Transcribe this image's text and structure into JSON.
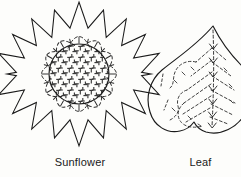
{
  "figure": {
    "type": "line-art-pattern-plate",
    "background_color": "#fdfdfb",
    "ink_color": "#1a1a1a",
    "width": 241,
    "height": 177
  },
  "motifs": [
    {
      "id": "sunflower",
      "name": "sunflower-motif",
      "caption": "Sunflower",
      "center": {
        "x": 79,
        "y": 74
      },
      "outline": {
        "shape": "star",
        "points": 16,
        "outer_radius": 72,
        "inner_radius": 47,
        "stroke": "solid"
      },
      "petal_ring": {
        "shape": "dashed-petal-arcs",
        "count": 12,
        "stroke": "dashed"
      },
      "disc": {
        "shape": "circle",
        "radius": 30,
        "stroke": "solid",
        "fill_texture": "cross-stitch-grid"
      },
      "radial_ticks": {
        "count": 24,
        "stroke": "dashed"
      }
    },
    {
      "id": "leaf",
      "name": "leaf-motif",
      "caption": "Leaf",
      "center": {
        "x": 203,
        "y": 88
      },
      "outline": {
        "shape": "heart-teardrop",
        "stroke": "solid",
        "apex": "pointed-top",
        "base": "rounded-notched"
      },
      "midrib": {
        "stroke": "dashed",
        "marks": "chevron-arrows",
        "mark_count": 7
      },
      "side_veins": {
        "count": 12,
        "stroke": "dashed"
      },
      "fill_texture": "scattered-dash-stitches"
    }
  ],
  "colors": {
    "ink": "#1a1a1a",
    "paper": "#fdfdfb",
    "texture": "#3a3a3a"
  }
}
